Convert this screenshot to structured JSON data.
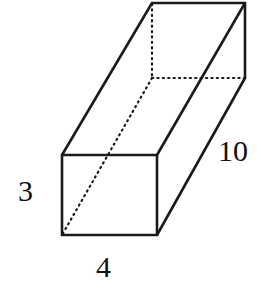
{
  "figure": {
    "name": "rectangular-prism-diagram",
    "shape": "rectangular prism",
    "background_color": "#ffffff",
    "stroke_color": "#1a1a1a",
    "hidden_edge_style": "dotted",
    "labels": {
      "height": "3",
      "width": "4",
      "length": "10"
    },
    "geometry": {
      "front_face": {
        "top_left": [
          62,
          155
        ],
        "top_right": [
          157,
          155
        ],
        "bottom_right": [
          157,
          235
        ],
        "bottom_left": [
          62,
          235
        ]
      },
      "back_face": {
        "top_left": [
          152,
          3
        ],
        "top_right": [
          245,
          3
        ],
        "bottom_right": [
          245,
          78
        ],
        "bottom_left": [
          152,
          78
        ]
      },
      "visible_edges": [
        "front-top",
        "front-right",
        "front-bottom",
        "front-left",
        "back-top",
        "back-right",
        "top-left-connector",
        "top-right-connector",
        "bottom-right-connector"
      ],
      "hidden_edges": [
        "back-left-vertical",
        "back-bottom-horizontal",
        "bottom-left-connector"
      ]
    }
  }
}
